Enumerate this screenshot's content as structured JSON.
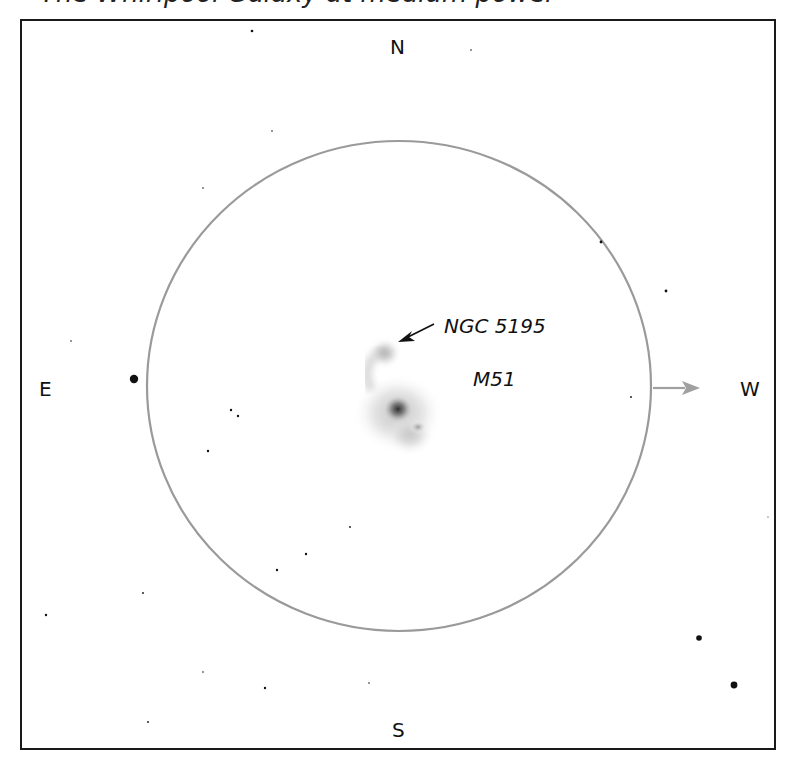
{
  "caption": "The Whirlpool Galaxy at medium power",
  "directions": {
    "north": "N",
    "south": "S",
    "east": "E",
    "west": "W"
  },
  "objects": {
    "main": {
      "name": "M51"
    },
    "companion": {
      "name": "NGC 5195"
    }
  },
  "field_of_view": {
    "center": [
      399,
      386
    ],
    "rx": 252,
    "ry": 245,
    "stroke_color": "#9a9a9a"
  },
  "motion_arrow": {
    "direction": "west",
    "color": "#a0a0a0"
  },
  "stars": [
    {
      "x": 252,
      "y": 31,
      "r": 1.3
    },
    {
      "x": 471,
      "y": 50,
      "r": 0.8
    },
    {
      "x": 272,
      "y": 131,
      "r": 0.8
    },
    {
      "x": 203,
      "y": 188,
      "r": 0.8
    },
    {
      "x": 601,
      "y": 242,
      "r": 1.4
    },
    {
      "x": 666,
      "y": 291,
      "r": 1.4
    },
    {
      "x": 71,
      "y": 341,
      "r": 0.8
    },
    {
      "x": 134,
      "y": 379,
      "r": 4.2
    },
    {
      "x": 631,
      "y": 397,
      "r": 0.9
    },
    {
      "x": 231,
      "y": 410,
      "r": 1.2
    },
    {
      "x": 238,
      "y": 416,
      "r": 1.2
    },
    {
      "x": 208,
      "y": 451,
      "r": 1.2
    },
    {
      "x": 350,
      "y": 527,
      "r": 0.9
    },
    {
      "x": 306,
      "y": 554,
      "r": 1.2
    },
    {
      "x": 277,
      "y": 570,
      "r": 1.2
    },
    {
      "x": 143,
      "y": 593,
      "r": 0.9
    },
    {
      "x": 46,
      "y": 615,
      "r": 1.2
    },
    {
      "x": 699,
      "y": 638,
      "r": 2.8
    },
    {
      "x": 203,
      "y": 672,
      "r": 0.8
    },
    {
      "x": 369,
      "y": 683,
      "r": 0.8
    },
    {
      "x": 265,
      "y": 688,
      "r": 1.2
    },
    {
      "x": 734,
      "y": 685,
      "r": 3.4
    },
    {
      "x": 148,
      "y": 722,
      "r": 0.9
    },
    {
      "x": 768,
      "y": 517,
      "r": 0.6
    }
  ]
}
